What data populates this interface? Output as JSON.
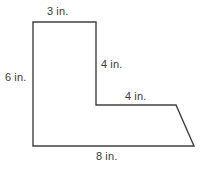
{
  "figure": {
    "name": "L-shaped polygon with slanted bottom-right edge",
    "units": "in.",
    "stroke_color": "#404040",
    "fill_color": "#ffffff",
    "background_color": "#ffffff",
    "text_color": "#3b3b3b",
    "labels": {
      "top": "3 in.",
      "left": "6 in.",
      "right_vertical": "4 in.",
      "ledge": "4 in.",
      "bottom": "8 in."
    },
    "vertices": [
      {
        "name": "top-left",
        "x": 33,
        "y": 22
      },
      {
        "name": "top-right",
        "x": 96,
        "y": 22
      },
      {
        "name": "inner-corner",
        "x": 96,
        "y": 105
      },
      {
        "name": "ledge-right",
        "x": 176,
        "y": 105
      },
      {
        "name": "bottom-right-slant",
        "x": 194,
        "y": 146
      },
      {
        "name": "bottom-left",
        "x": 33,
        "y": 146
      }
    ],
    "edges": [
      {
        "name": "top-edge",
        "label": "3 in."
      },
      {
        "name": "right-vertical-edge",
        "label": "4 in."
      },
      {
        "name": "ledge-edge",
        "label": "4 in."
      },
      {
        "name": "slanted-edge",
        "label": ""
      },
      {
        "name": "bottom-edge",
        "label": "8 in."
      },
      {
        "name": "left-edge",
        "label": "6 in."
      }
    ]
  }
}
